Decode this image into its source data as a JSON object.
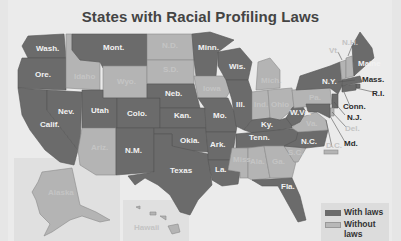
{
  "title": "States with Racial Profiling Laws",
  "colors": {
    "with_laws": "#6b6b6b",
    "without_laws": "#b4b4b4",
    "background": "#ebebeb"
  },
  "legend": {
    "with_label": "With laws",
    "without_label": "Without laws"
  },
  "states_with_laws": [
    "Wash.",
    "Ore.",
    "Calif.",
    "Nev.",
    "Utah",
    "Mont.",
    "Colo.",
    "N.M.",
    "Neb.",
    "Kan.",
    "Okla.",
    "Texas",
    "Minn.",
    "Wis.",
    "Mo.",
    "Ark.",
    "La.",
    "Ill.",
    "Ky.",
    "Tenn.",
    "W.Va.",
    "N.C.",
    "Fla.",
    "N.Y.",
    "Maine",
    "Mass.",
    "R.I.",
    "Conn.",
    "N.J.",
    "Md."
  ],
  "states_without_laws": [
    "Idaho",
    "Wyo.",
    "N.D.",
    "S.D.",
    "Iowa",
    "Ariz.",
    "Mich.",
    "Ind.",
    "Ohio",
    "Pa.",
    "Va.",
    "Miss.",
    "Ala.",
    "Ga.",
    "S.C.",
    "Vt.",
    "N.H.",
    "Del.",
    "D.C.",
    "Alaska",
    "Hawaii"
  ],
  "labels": {
    "wash": "Wash.",
    "ore": "Ore.",
    "calif": "Calif.",
    "nev": "Nev.",
    "idaho": "Idaho",
    "mont": "Mont.",
    "wyo": "Wyo.",
    "utah": "Utah",
    "colo": "Colo.",
    "ariz": "Ariz.",
    "nm": "N.M.",
    "nd": "N.D.",
    "sd": "S.D.",
    "neb": "Neb.",
    "kan": "Kan.",
    "okla": "Okla.",
    "texas": "Texas",
    "minn": "Minn.",
    "iowa": "Iowa",
    "mo": "Mo.",
    "ark": "Ark.",
    "la": "La.",
    "wis": "Wis.",
    "ill": "Ill.",
    "mich": "Mich.",
    "ind": "Ind.",
    "ohio": "Ohio",
    "ky": "Ky.",
    "tenn": "Tenn.",
    "miss": "Miss.",
    "ala": "Ala.",
    "ga": "Ga.",
    "fla": "Fla.",
    "sc": "S.C.",
    "nc": "N.C.",
    "va": "Va.",
    "wva": "W.Va.",
    "pa": "Pa.",
    "ny": "N.Y.",
    "vt": "Vt.",
    "nh": "N.H.",
    "maine": "Maine",
    "mass": "Mass.",
    "ri": "R.I.",
    "conn": "Conn.",
    "nj": "N.J.",
    "del": "Del.",
    "md": "Md.",
    "dc": "D.C.",
    "alaska": "Alaska",
    "hawaii": "Hawaii"
  }
}
